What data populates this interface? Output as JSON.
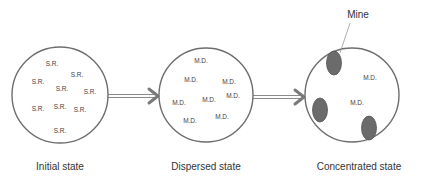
{
  "diagram": {
    "type": "process-flow",
    "states": [
      {
        "caption": "Initial state",
        "circle": {
          "cx": 60,
          "cy": 95,
          "r": 48
        },
        "caption_pos": {
          "x": 60,
          "y": 167
        },
        "tokens": [
          {
            "text": "S.R.",
            "x": 52,
            "y": 64
          },
          {
            "text": "S.R.",
            "x": 77,
            "y": 75
          },
          {
            "text": "S.R.",
            "x": 38,
            "y": 82
          },
          {
            "text": "S.R.",
            "x": 62,
            "y": 89
          },
          {
            "text": "S.R.",
            "x": 90,
            "y": 92
          },
          {
            "text": "S.R.",
            "x": 38,
            "y": 109
          },
          {
            "text": "S.R.",
            "x": 60,
            "y": 107
          },
          {
            "text": "S.R.",
            "x": 80,
            "y": 110
          },
          {
            "text": "S.R.",
            "x": 60,
            "y": 131
          }
        ]
      },
      {
        "caption": "Dispersed state",
        "circle": {
          "cx": 206,
          "cy": 95,
          "r": 47
        },
        "caption_pos": {
          "x": 206,
          "y": 167
        },
        "tokens": [
          {
            "text": "M.D.",
            "x": 201,
            "y": 61
          },
          {
            "text": "M.D.",
            "x": 191,
            "y": 80
          },
          {
            "text": "M.D.",
            "x": 229,
            "y": 82
          },
          {
            "text": "M.D.",
            "x": 233,
            "y": 96
          },
          {
            "text": "M.D.",
            "x": 179,
            "y": 103
          },
          {
            "text": "M.D.",
            "x": 209,
            "y": 100
          },
          {
            "text": "M.D.",
            "x": 190,
            "y": 121
          },
          {
            "text": "M.D.",
            "x": 222,
            "y": 117
          }
        ]
      },
      {
        "caption": "Concentrated state",
        "circle": {
          "cx": 352,
          "cy": 95,
          "r": 47
        },
        "caption_pos": {
          "x": 359,
          "y": 167
        },
        "tokens": [
          {
            "text": "M.D.",
            "x": 370,
            "y": 78
          },
          {
            "text": "M.D.",
            "x": 357,
            "y": 103
          }
        ],
        "mines": [
          {
            "cx": 334,
            "cy": 63,
            "rx": 7.5,
            "ry": 12
          },
          {
            "cx": 320,
            "cy": 110,
            "rx": 7.5,
            "ry": 12
          },
          {
            "cx": 369,
            "cy": 128,
            "rx": 7.5,
            "ry": 12
          }
        ]
      }
    ],
    "arrows": [
      {
        "from": "Initial state",
        "to": "Dispersed state",
        "x1": 108,
        "x2": 158,
        "y": 96
      },
      {
        "from": "Dispersed state",
        "to": "Concentrated state",
        "x1": 253,
        "x2": 304,
        "y": 97
      }
    ],
    "annotation": {
      "label": "Mine",
      "label_pos": {
        "x": 358,
        "y": 15
      },
      "pointer": {
        "x1": 350,
        "y1": 23,
        "x2": 340,
        "y2": 53
      }
    },
    "colors": {
      "circle_stroke": "#6e6e6e",
      "mine_fill": "#6b6b6b",
      "arrow": "#7a7a7a",
      "text": "#333333"
    }
  }
}
